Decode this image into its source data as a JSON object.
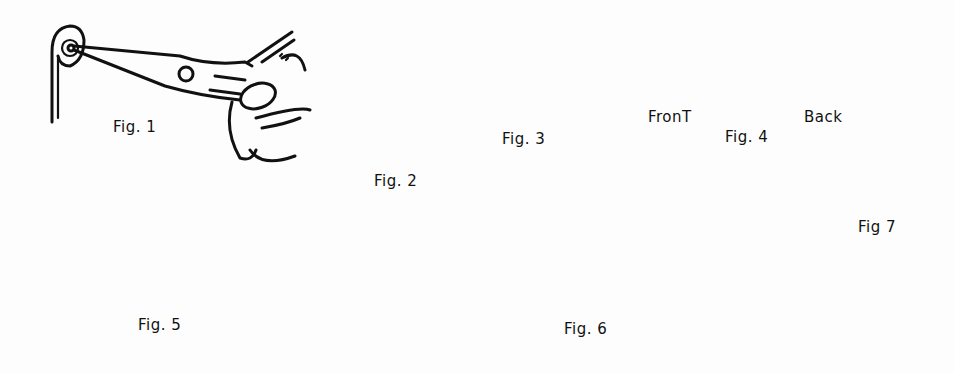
{
  "illustration": {
    "background_color": "#fdfdfd",
    "ink_color": "#111111",
    "figures": [
      {
        "id": "fig1",
        "label": "Fig. 1",
        "description": "hand holding round-nose pliers coiling end of wire into spiral"
      },
      {
        "id": "fig2",
        "label": "Fig. 2",
        "description": "wire bent into loop with two spirals"
      },
      {
        "id": "fig3",
        "label": "Fig. 3",
        "description": "double spiral with loop bent back flat"
      },
      {
        "id": "fig4",
        "label": "Fig. 4",
        "description": "double spiral unit shown front and back",
        "sub_labels": {
          "front": "FronT",
          "back": "Back"
        }
      },
      {
        "id": "fig5",
        "label": "Fig. 5",
        "description": "two spiral units linked together, and assembled four-spiral unit"
      },
      {
        "id": "fig6",
        "label": "Fig. 6",
        "description": "jump ring through double spiral; long loop bent over with arrow"
      },
      {
        "id": "fig7",
        "label": "Fig 7",
        "description": "single spiral twisted onto four-spiral unit"
      }
    ]
  }
}
